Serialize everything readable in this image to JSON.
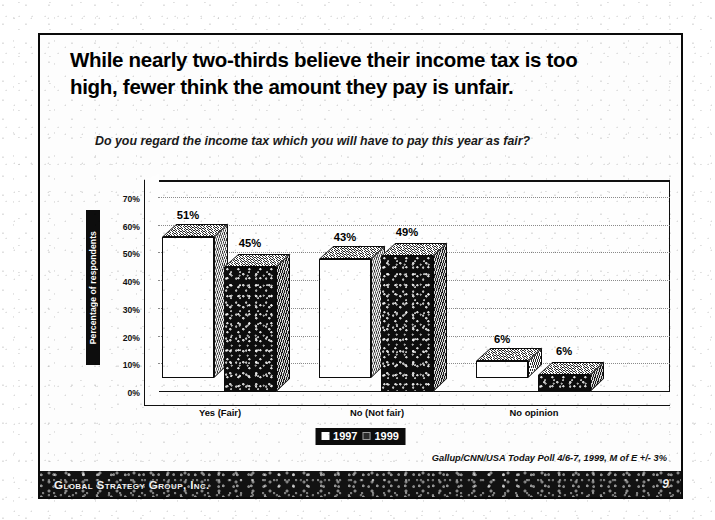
{
  "slide": {
    "title": "While nearly two-thirds believe their income tax is too high, fewer think the amount they pay is unfair.",
    "question": "Do you regard the income tax which you will have to pay this year as fair?",
    "source": "Gallup/CNN/USA Today Poll  4/6-7, 1999, M of E +/- 3%"
  },
  "footer": {
    "brand": "Global Strategy Group, Inc.",
    "page_number": "9"
  },
  "chart_data": {
    "type": "bar",
    "title": "",
    "xlabel": "",
    "ylabel": "Percentage of respondents",
    "ylim": [
      0,
      70
    ],
    "grid": true,
    "legend_position": "bottom",
    "categories": [
      "Yes (Fair)",
      "No (Not fair)",
      "No opinion"
    ],
    "ticks": [
      "0%",
      "10%",
      "20%",
      "30%",
      "40%",
      "50%",
      "60%",
      "70%"
    ],
    "tick_values": [
      0,
      10,
      20,
      30,
      40,
      50,
      60,
      70
    ],
    "series": [
      {
        "name": "1997",
        "style": "light",
        "values": [
          51,
          43,
          6
        ],
        "labels": [
          "51%",
          "43%",
          "6%"
        ]
      },
      {
        "name": "1999",
        "style": "dark",
        "values": [
          45,
          49,
          6
        ],
        "labels": [
          "45%",
          "49%",
          "6%"
        ]
      }
    ]
  }
}
